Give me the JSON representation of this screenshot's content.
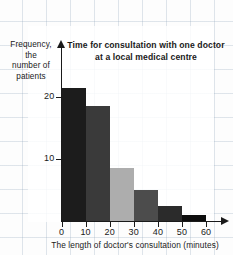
{
  "chart_data": {
    "type": "bar",
    "title": "Time for consultation with one doctor at a local medical centre",
    "title_line1": "Time for consultation with one doctor",
    "title_line2": "at a local medical centre",
    "xlabel": "The length of doctor's consultation (minutes)",
    "ylabel": "Frequency, the number of patients",
    "ylabel_line1": "Frequency, the",
    "ylabel_line2": "number of",
    "ylabel_line3": "patients",
    "categories": [
      "0-10",
      "10-20",
      "20-30",
      "30-40",
      "40-50",
      "50-60"
    ],
    "values": [
      21.5,
      18.5,
      8.5,
      5,
      2.5,
      1
    ],
    "bin_edges": [
      0,
      10,
      20,
      30,
      40,
      50,
      60
    ],
    "bar_colors": [
      "#1c1c1c",
      "#3a3a3a",
      "#adadad",
      "#4c4c4c",
      "#2b2b2b",
      "#0d0d0d"
    ],
    "xlim": [
      0,
      60
    ],
    "ylim": [
      0,
      24
    ],
    "xticks": [
      0,
      10,
      20,
      30,
      40,
      50,
      60
    ],
    "xtick_labels": [
      "0",
      "10",
      "20",
      "30",
      "40",
      "50",
      "60"
    ],
    "yticks": [
      10,
      20
    ],
    "ytick_labels": [
      "10",
      "20"
    ],
    "grid": true,
    "legend": "none",
    "axis_color": "#1a1a1a",
    "grid_color": "#96aabe",
    "background": "#fdfdfd"
  },
  "bars": [
    {
      "label": "0-10",
      "value": 21.5,
      "color": "#1c1c1c"
    },
    {
      "label": "10-20",
      "value": 18.5,
      "color": "#3a3a3a"
    },
    {
      "label": "20-30",
      "value": 8.5,
      "color": "#adadad"
    },
    {
      "label": "30-40",
      "value": 5,
      "color": "#4c4c4c"
    },
    {
      "label": "40-50",
      "value": 2.5,
      "color": "#2b2b2b"
    },
    {
      "label": "50-60",
      "value": 1,
      "color": "#0d0d0d"
    }
  ]
}
